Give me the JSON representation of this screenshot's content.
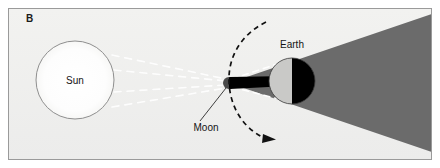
{
  "figure": {
    "panel_label": "B",
    "background_color": "#efefed",
    "border_color": "#9a9a9a",
    "frame": {
      "x": 8,
      "y": 8,
      "width": 424,
      "height": 152
    }
  },
  "diagram": {
    "title_hidden": "Solar eclipse geometry: Sun, Moon and Earth alignment",
    "bodies": [
      {
        "name": "sun",
        "label": "Sun",
        "shape": "circle",
        "cx": 75,
        "cy": 80,
        "r": 39,
        "fill": "#fdfdfc",
        "stroke": "#8f8f8f",
        "label_x": 75,
        "label_y": 84
      },
      {
        "name": "moon",
        "label": "Moon",
        "shape": "circle",
        "cx": 229,
        "cy": 83,
        "r": 6,
        "fill_lit": "#4a4a4a",
        "fill_dark": "#000000",
        "label_x": 206,
        "label_y": 131
      },
      {
        "name": "earth",
        "label": "Earth",
        "shape": "circle",
        "cx": 292,
        "cy": 81,
        "r": 23,
        "fill_lit": "#c9c9c7",
        "fill_dark": "#000000",
        "stroke": "#3a3a3a",
        "label_x": 292,
        "label_y": 48
      }
    ],
    "shadows": [
      {
        "name": "earth-penumbra-cone",
        "type": "cone",
        "color": "#6b6b6b",
        "apex_x": 229,
        "apex_y": 83,
        "end_x": 432,
        "top_y": 16,
        "bottom_y": 150
      },
      {
        "name": "moon-umbra-cone",
        "type": "cone",
        "color": "#000000",
        "apex_x": 231,
        "apex_y": 83,
        "end_x": 284,
        "half_width": 9
      }
    ],
    "light_rays": {
      "name": "sunlight-rays",
      "style": "dashed",
      "color": "#ffffff",
      "count": 4,
      "origin": "sun",
      "target": "moon"
    },
    "orbit": {
      "name": "moon-orbit-arc",
      "style": "dashed",
      "color": "#111111",
      "dash": "5 4",
      "arrow": true,
      "arrow_x": 272,
      "arrow_y": 138,
      "description": "dashed arc showing Moon orbital path around Earth"
    },
    "leader_line": {
      "name": "moon-leader-line",
      "from_x": 200,
      "from_y": 122,
      "to_x": 226,
      "to_y": 88,
      "color": "#2a2a2a"
    }
  }
}
